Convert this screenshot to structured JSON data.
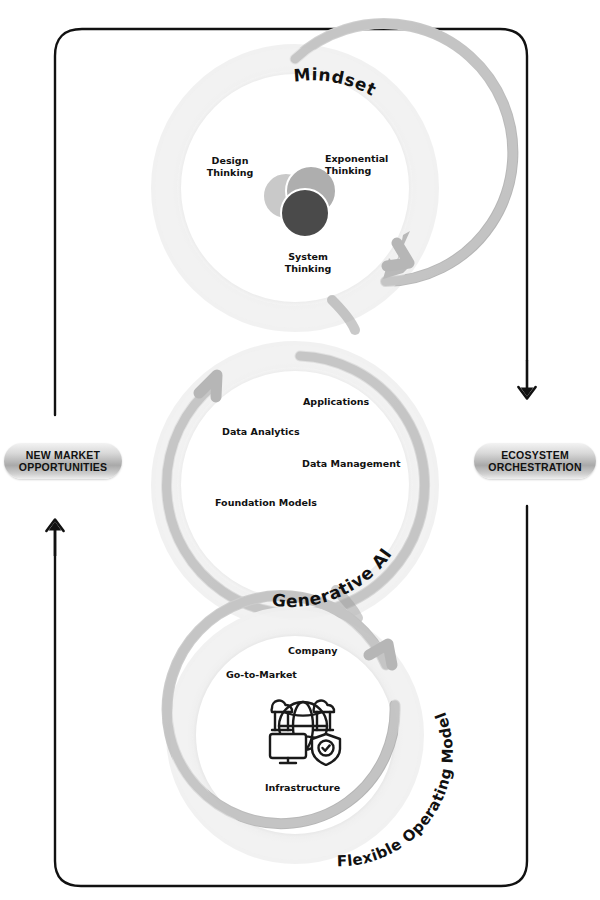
{
  "diagram": {
    "title_present": false,
    "frame": {
      "shape": "rounded-rectangle",
      "stroke": "#111111"
    },
    "colors": {
      "ring_outer_glow": "#ebebeb",
      "ring_band": "#c6c6c6",
      "ring_band_dark": "#a8a8a8",
      "arrow_gray": "#b3b3b3",
      "text": "#111111",
      "badge_dark": "#a9a9a9",
      "badge_light": "#f2f2f2",
      "venn_light": "#c9c9c9",
      "venn_mid": "#aeaeae",
      "venn_dark": "#4a4a4a"
    },
    "flow_badges": [
      {
        "id": "new-market-opportunities",
        "line1": "NEW MARKET",
        "line2": "OPPORTUNITIES",
        "side": "left"
      },
      {
        "id": "ecosystem-orchestration",
        "line1": "ECOSYSTEM",
        "line2": "ORCHESTRATION",
        "side": "right"
      }
    ],
    "flow_arrows": [
      {
        "id": "left-arrow-up",
        "direction": "up",
        "label": "New market opportunities flow upward"
      },
      {
        "id": "right-arrow-down",
        "direction": "down",
        "label": "Ecosystem orchestration flows downward"
      }
    ],
    "rings": [
      {
        "id": "mindset",
        "label": "Mindset",
        "label_style": "curved",
        "rotation_arrow": "clockwise",
        "icon": "three-overlapping-circles-icon",
        "nodes": [
          {
            "id": "design-thinking",
            "text": "Design\nThinking"
          },
          {
            "id": "exponential-thinking",
            "text": "Exponential\nThinking"
          },
          {
            "id": "system-thinking",
            "text": "System\nThinking"
          }
        ]
      },
      {
        "id": "generative-ai",
        "label": "Generative AI",
        "label_style": "curved",
        "rotation_arrow": "counter-clockwise",
        "icon": null,
        "nodes": [
          {
            "id": "applications",
            "text": "Applications"
          },
          {
            "id": "data-analytics",
            "text": "Data Analytics"
          },
          {
            "id": "data-management",
            "text": "Data Management"
          },
          {
            "id": "foundation-models",
            "text": "Foundation Models"
          }
        ]
      },
      {
        "id": "flexible-operating-model",
        "label": "Flexible Operating Model",
        "label_style": "curved",
        "rotation_arrow": "counter-clockwise",
        "icon": "globe-cloud-monitor-shield-icon",
        "nodes": [
          {
            "id": "company",
            "text": "Company"
          },
          {
            "id": "go-to-market",
            "text": "Go-to-Market"
          },
          {
            "id": "infrastructure",
            "text": "Infrastructure"
          }
        ]
      }
    ]
  }
}
